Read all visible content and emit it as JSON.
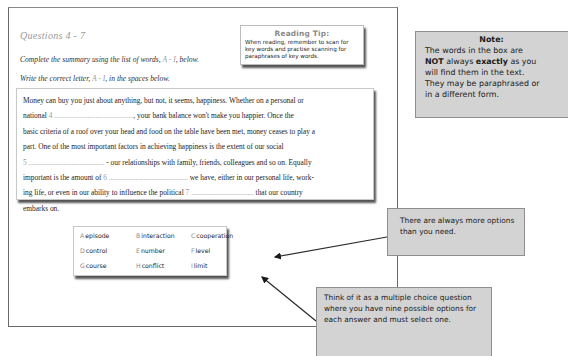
{
  "question": {
    "title": "Questions 4 - 7",
    "instruction_1_pre": "Complete the summary using the list of words, ",
    "instruction_1_range": "A - I",
    "instruction_1_post": ", below.",
    "instruction_2_pre": "Write the correct letter, ",
    "instruction_2_range": "A - I",
    "instruction_2_post": ", in the spaces below."
  },
  "reading_tip": {
    "title": "Reading Tip:",
    "body": "When reading, remember to scan for key words and practise scanning for paraphrases of key words."
  },
  "passage": {
    "line1": "Money can buy you just about anything, but not, it seems, happiness. Whether on a personal or",
    "line2_pre": "national ",
    "gap4_num": "4",
    "gap4_dots": "................................................",
    "line2_post": ", your bank balance won't make you happier. Once the",
    "line3": "basic criteria of a roof over your head and food on the table have been met, money ceases to play a",
    "line4": "part. One of the most important factors in achieving happiness is the extent of our social",
    "gap5_num": "5",
    "gap5_dots": "..............................................",
    "line5_post": " - our relationships with family, friends, colleagues and so on. Equally",
    "line6_pre": "important is the amount of ",
    "gap6_num": "6",
    "gap6_dots": "................................................",
    "line6_post": " we have, either in our personal life, work-",
    "line7_pre": "ing life, or even in our ability to influence the political ",
    "gap7_num": "7",
    "gap7_dots": "......................................",
    "line7_post": " that our country",
    "line8": "embarks on."
  },
  "options": [
    {
      "letter": "A",
      "word": "episode"
    },
    {
      "letter": "B",
      "word": "interaction"
    },
    {
      "letter": "C",
      "word": "cooperation"
    },
    {
      "letter": "D",
      "word": "control"
    },
    {
      "letter": "E",
      "word": "number"
    },
    {
      "letter": "F",
      "word": "level"
    },
    {
      "letter": "G",
      "word": "course"
    },
    {
      "letter": "H",
      "word": "conflict"
    },
    {
      "letter": "I",
      "word": "limit"
    }
  ],
  "note": {
    "title": "Note:",
    "line1": "The words in the box are",
    "not": "NOT",
    "always": " always ",
    "exactly": "exactly",
    "as_you": " as you",
    "line3": "will find them in the text.",
    "line4": "They may be paraphrased or",
    "line5": "in a different form."
  },
  "callouts": {
    "more_options": "There are always more options than you need.",
    "multiple_choice": "Think of it as a multiple choice question where you have nine possible options for each answer and must select one."
  }
}
